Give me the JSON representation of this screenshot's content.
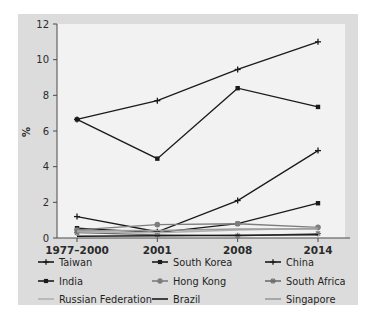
{
  "figure": {
    "panel_bg": "#dcdcdc",
    "plot_bg": "#f2f2f2",
    "axis_color": "#4a4a4a"
  },
  "chart_data": {
    "type": "line",
    "title": "",
    "xlabel": "",
    "ylabel": "%",
    "categories": [
      "1977–2000",
      "2001",
      "2008",
      "2014"
    ],
    "ylim": [
      0,
      12
    ],
    "yticks": [
      0,
      2,
      4,
      6,
      8,
      10,
      12
    ],
    "grid": false,
    "legend_position": "bottom",
    "series": [
      {
        "name": "Taiwan",
        "values": [
          6.65,
          7.7,
          9.45,
          11.0
        ],
        "marker": "plus",
        "color": "#1a1a1a"
      },
      {
        "name": "South Korea",
        "values": [
          6.65,
          4.45,
          8.4,
          7.35
        ],
        "marker": "square",
        "color": "#1a1a1a"
      },
      {
        "name": "China",
        "values": [
          1.2,
          0.35,
          2.1,
          4.9
        ],
        "marker": "plus",
        "color": "#1a1a1a"
      },
      {
        "name": "India",
        "values": [
          0.55,
          0.3,
          0.8,
          1.95
        ],
        "marker": "square",
        "color": "#1a1a1a"
      },
      {
        "name": "Hong Kong",
        "values": [
          0.45,
          0.75,
          0.8,
          0.6
        ],
        "marker": "circle",
        "color": "#7d7d7d"
      },
      {
        "name": "South Africa",
        "values": [
          0.3,
          0.18,
          0.12,
          0.25
        ],
        "marker": "asterisk",
        "color": "#6e6e6e"
      },
      {
        "name": "Russian Federation",
        "values": [
          0.35,
          0.3,
          0.45,
          0.55
        ],
        "marker": "line",
        "color": "#b0b0b0"
      },
      {
        "name": "Brazil",
        "values": [
          0.1,
          0.12,
          0.15,
          0.18
        ],
        "marker": "line",
        "color": "#1a1a1a"
      },
      {
        "name": "Singapore",
        "values": [
          0.4,
          0.42,
          0.5,
          0.5
        ],
        "marker": "line",
        "color": "#9a9a9a"
      }
    ]
  },
  "legend": {
    "items": [
      {
        "label": "Taiwan"
      },
      {
        "label": "South Korea"
      },
      {
        "label": "China"
      },
      {
        "label": "India"
      },
      {
        "label": "Hong Kong"
      },
      {
        "label": "South Africa"
      },
      {
        "label": "Russian Federation"
      },
      {
        "label": "Brazil"
      },
      {
        "label": "Singapore"
      }
    ]
  }
}
